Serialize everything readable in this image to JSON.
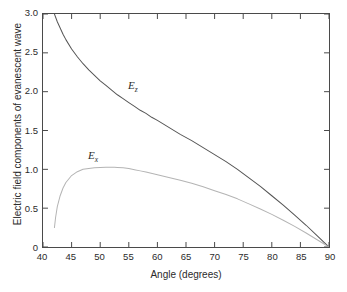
{
  "chart_data": {
    "type": "line",
    "title": "",
    "xlabel": "Angle (degrees)",
    "ylabel": "Electric field components of evanescent wave",
    "xlim": [
      40,
      90
    ],
    "ylim": [
      0,
      3.0
    ],
    "grid": false,
    "legend_position": "inline-annotations",
    "xticks": [
      "40",
      "45",
      "50",
      "55",
      "60",
      "65",
      "70",
      "75",
      "80",
      "85",
      "90"
    ],
    "xtick_values": [
      40,
      45,
      50,
      55,
      60,
      65,
      70,
      75,
      80,
      85,
      90
    ],
    "yticks": [
      "0",
      "0.5",
      "1.0",
      "1.5",
      "2.0",
      "2.5",
      "3.0"
    ],
    "ytick_values": [
      0,
      0.5,
      1.0,
      1.5,
      2.0,
      2.5,
      3.0
    ],
    "series": [
      {
        "name": "Ez",
        "label": "E",
        "subscript": "z",
        "color": "#555555",
        "x": [
          42.0,
          42.5,
          43.0,
          43.5,
          44.0,
          45.0,
          46.0,
          47.0,
          48.0,
          49.0,
          50.0,
          51.0,
          52.0,
          53.0,
          54.0,
          55.0,
          56.0,
          57.0,
          58.0,
          59.0,
          60.0,
          62.0,
          64.0,
          66.0,
          68.0,
          70.0,
          72.0,
          74.0,
          76.0,
          78.0,
          80.0,
          82.0,
          84.0,
          86.0,
          88.0,
          89.0,
          90.0
        ],
        "y": [
          3.0,
          2.9,
          2.82,
          2.74,
          2.67,
          2.55,
          2.45,
          2.36,
          2.28,
          2.21,
          2.14,
          2.08,
          2.02,
          1.96,
          1.91,
          1.86,
          1.81,
          1.76,
          1.72,
          1.67,
          1.63,
          1.54,
          1.45,
          1.37,
          1.28,
          1.19,
          1.1,
          1.0,
          0.89,
          0.78,
          0.66,
          0.54,
          0.41,
          0.28,
          0.14,
          0.07,
          0.0
        ]
      },
      {
        "name": "Ex",
        "label": "E",
        "subscript": "x",
        "color": "#b4b4b4",
        "x": [
          42.0,
          42.2,
          42.5,
          43.0,
          43.5,
          44.0,
          45.0,
          46.0,
          47.0,
          48.0,
          49.0,
          50.0,
          51.0,
          52.0,
          52.5,
          53.0,
          54.0,
          55.0,
          56.0,
          57.0,
          58.0,
          60.0,
          62.0,
          64.0,
          66.0,
          68.0,
          70.0,
          72.0,
          74.0,
          76.0,
          78.0,
          80.0,
          82.0,
          84.0,
          86.0,
          88.0,
          89.0,
          90.0
        ],
        "y": [
          0.25,
          0.38,
          0.52,
          0.66,
          0.76,
          0.83,
          0.92,
          0.97,
          1.0,
          1.01,
          1.02,
          1.025,
          1.027,
          1.028,
          1.027,
          1.025,
          1.02,
          1.01,
          0.995,
          0.98,
          0.965,
          0.93,
          0.895,
          0.86,
          0.82,
          0.775,
          0.725,
          0.675,
          0.62,
          0.555,
          0.49,
          0.42,
          0.345,
          0.265,
          0.18,
          0.09,
          0.045,
          0.0
        ]
      }
    ]
  },
  "axes": {
    "frame_color": "#4a4a4a",
    "tick_color": "#4a4a4a",
    "text_color": "#2b2b2b"
  }
}
